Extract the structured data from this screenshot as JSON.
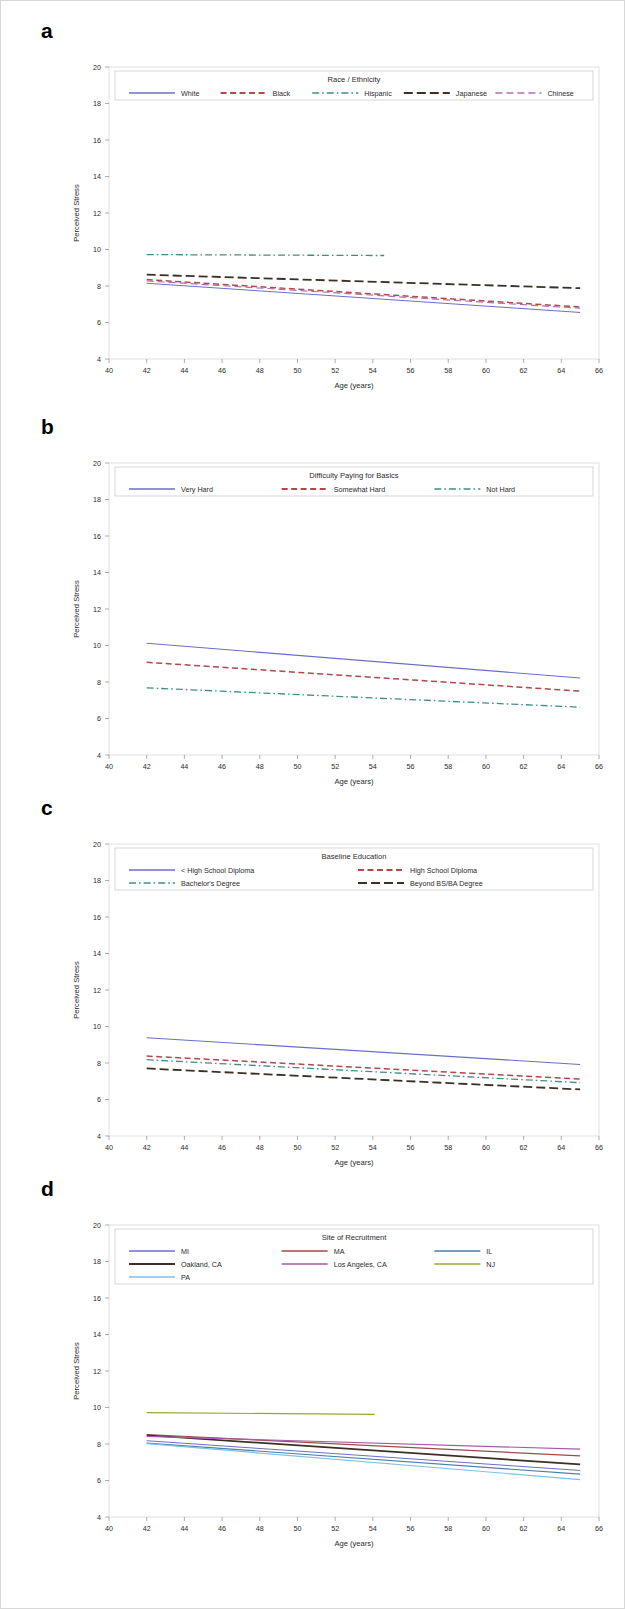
{
  "figure": {
    "axis": {
      "xlabel": "Age (years)",
      "ylabel": "Perceived Stress",
      "xticks": [
        40,
        42,
        44,
        46,
        48,
        50,
        52,
        54,
        56,
        58,
        60,
        62,
        64,
        66
      ],
      "yticks": [
        4,
        6,
        8,
        10,
        12,
        14,
        16,
        18,
        20
      ],
      "xlim": [
        40,
        66
      ],
      "ylim": [
        4,
        20
      ]
    },
    "panels": [
      {
        "letter": "a",
        "legend_title": "Race / Ethnicity",
        "legend_columns": 5,
        "chart_data": {
          "type": "line",
          "title": "Race / Ethnicity",
          "xlabel": "Age (years)",
          "ylabel": "Perceived Stress",
          "xlim": [
            40,
            66
          ],
          "ylim": [
            4,
            20
          ],
          "grid": false,
          "legend_position": "top-inside",
          "series": [
            {
              "name": "White",
              "color": "#6b6fc4",
              "dash": "none",
              "width": 1.0,
              "x": [
                42,
                65
              ],
              "values": [
                8.15,
                6.55
              ]
            },
            {
              "name": "Black",
              "color": "#b2484a",
              "dash": "dash",
              "width": 1.5,
              "x": [
                42,
                65
              ],
              "values": [
                8.35,
                6.85
              ]
            },
            {
              "name": "Hispanic",
              "color": "#3f8f80",
              "dash": "dashdot",
              "width": 1.3,
              "x": [
                42,
                54.6
              ],
              "values": [
                9.72,
                9.67
              ]
            },
            {
              "name": "Japanese",
              "color": "#3b3026",
              "dash": "longdash",
              "width": 1.8,
              "x": [
                42,
                65
              ],
              "values": [
                8.62,
                7.88
              ]
            },
            {
              "name": "Chinese",
              "color": "#b26fb0",
              "dash": "dashlong",
              "width": 1.2,
              "x": [
                42,
                65
              ],
              "values": [
                8.28,
                6.78
              ]
            }
          ]
        }
      },
      {
        "letter": "b",
        "legend_title": "Difficulty Paying for Basics",
        "legend_columns": 3,
        "chart_data": {
          "type": "line",
          "title": "Difficulty Paying for Basics",
          "xlabel": "Age (years)",
          "ylabel": "Perceived Stress",
          "xlim": [
            40,
            66
          ],
          "ylim": [
            4,
            20
          ],
          "grid": false,
          "legend_position": "top-inside",
          "series": [
            {
              "name": "Very Hard",
              "color": "#6b6fc4",
              "dash": "none",
              "width": 1.1,
              "x": [
                42,
                65
              ],
              "values": [
                10.12,
                8.22
              ]
            },
            {
              "name": "Somewhat Hard",
              "color": "#b2484a",
              "dash": "dash",
              "width": 1.5,
              "x": [
                42,
                65
              ],
              "values": [
                9.08,
                7.5
              ]
            },
            {
              "name": "Not Hard",
              "color": "#3f8f80",
              "dash": "dashdot",
              "width": 1.3,
              "x": [
                42,
                65
              ],
              "values": [
                7.68,
                6.62
              ]
            }
          ]
        }
      },
      {
        "letter": "c",
        "legend_title": "Baseline Education",
        "legend_columns": 2,
        "chart_data": {
          "type": "line",
          "title": "Baseline Education",
          "xlabel": "Age (years)",
          "ylabel": "Perceived Stress",
          "xlim": [
            40,
            66
          ],
          "ylim": [
            4,
            20
          ],
          "grid": false,
          "legend_position": "top-inside",
          "series": [
            {
              "name": "< High School Diploma",
              "color": "#6b6fc4",
              "dash": "none",
              "width": 1.1,
              "x": [
                42,
                65
              ],
              "values": [
                9.38,
                7.92
              ]
            },
            {
              "name": "High School Diploma",
              "color": "#b2484a",
              "dash": "dash",
              "width": 1.5,
              "x": [
                42,
                65
              ],
              "values": [
                8.38,
                7.12
              ]
            },
            {
              "name": "Bachelor's Degree",
              "color": "#3f8f80",
              "dash": "dashdot",
              "width": 1.3,
              "x": [
                42,
                65
              ],
              "values": [
                8.18,
                6.92
              ]
            },
            {
              "name": "Beyond BS/BA Degree",
              "color": "#3b3026",
              "dash": "longdash",
              "width": 1.8,
              "x": [
                42,
                65
              ],
              "values": [
                7.7,
                6.55
              ]
            }
          ]
        }
      },
      {
        "letter": "d",
        "legend_title": "Site of Recruitment",
        "legend_columns": 3,
        "chart_data": {
          "type": "line",
          "title": "Site of Recruitment",
          "xlabel": "Age (years)",
          "ylabel": "Perceived Stress",
          "xlim": [
            40,
            66
          ],
          "ylim": [
            4,
            20
          ],
          "grid": false,
          "legend_position": "top-inside",
          "series": [
            {
              "name": "MI",
              "color": "#6b6fc4",
              "dash": "none",
              "width": 1.0,
              "x": [
                42,
                65
              ],
              "values": [
                8.18,
                6.55
              ]
            },
            {
              "name": "MA",
              "color": "#a0494a",
              "dash": "none",
              "width": 1.2,
              "x": [
                42,
                65
              ],
              "values": [
                8.52,
                7.35
              ]
            },
            {
              "name": "IL",
              "color": "#4b7fa6",
              "dash": "none",
              "width": 1.1,
              "x": [
                42,
                65
              ],
              "values": [
                8.05,
                6.35
              ]
            },
            {
              "name": "Oakland, CA",
              "color": "#3b2f26",
              "dash": "none",
              "width": 1.7,
              "x": [
                42,
                65
              ],
              "values": [
                8.48,
                6.88
              ]
            },
            {
              "name": "Los Angeles, CA",
              "color": "#a45aa8",
              "dash": "none",
              "width": 1.2,
              "x": [
                42,
                65
              ],
              "values": [
                8.42,
                7.72
              ]
            },
            {
              "name": "NJ",
              "color": "#9aa532",
              "dash": "none",
              "width": 1.2,
              "x": [
                42,
                54.1
              ],
              "values": [
                9.72,
                9.62
              ]
            },
            {
              "name": "PA",
              "color": "#7ec2e8",
              "dash": "none",
              "width": 1.2,
              "x": [
                42,
                65
              ],
              "values": [
                8.02,
                6.05
              ]
            }
          ]
        }
      }
    ]
  }
}
